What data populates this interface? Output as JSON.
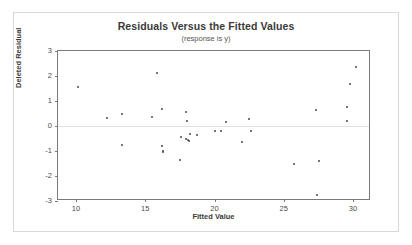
{
  "chart_data": {
    "type": "scatter",
    "title": "Residuals Versus the Fitted Values",
    "subtitle": "(response is y)",
    "xlabel": "Fitted Value",
    "ylabel": "Deleted Residual",
    "xlim": [
      8.7,
      31.3
    ],
    "ylim": [
      -3,
      3
    ],
    "xticks": [
      10,
      15,
      20,
      25,
      30
    ],
    "yticks": [
      3,
      2,
      1,
      0,
      -1,
      -2,
      -3
    ],
    "grid": false,
    "legend": null,
    "reference_line_y": 0,
    "marker_color": "#4a4a4a",
    "frame_color": "#7a7a7a",
    "points": [
      {
        "x": 10.15,
        "y": 1.55
      },
      {
        "x": 12.25,
        "y": 0.33
      },
      {
        "x": 13.35,
        "y": 0.5
      },
      {
        "x": 13.3,
        "y": -0.75
      },
      {
        "x": 15.5,
        "y": 0.35
      },
      {
        "x": 15.85,
        "y": 2.12
      },
      {
        "x": 16.2,
        "y": 0.7
      },
      {
        "x": 16.2,
        "y": -0.8
      },
      {
        "x": 16.25,
        "y": -1.0
      },
      {
        "x": 16.3,
        "y": -1.05
      },
      {
        "x": 17.5,
        "y": -1.37
      },
      {
        "x": 17.55,
        "y": -0.42
      },
      {
        "x": 17.95,
        "y": 0.58
      },
      {
        "x": 18.05,
        "y": 0.22
      },
      {
        "x": 17.95,
        "y": -0.5
      },
      {
        "x": 18.1,
        "y": -0.55
      },
      {
        "x": 18.15,
        "y": -0.58
      },
      {
        "x": 18.2,
        "y": -0.33
      },
      {
        "x": 18.75,
        "y": -0.35
      },
      {
        "x": 20.0,
        "y": -0.2
      },
      {
        "x": 20.45,
        "y": -0.21
      },
      {
        "x": 20.85,
        "y": 0.15
      },
      {
        "x": 22.0,
        "y": -0.65
      },
      {
        "x": 22.5,
        "y": 0.3
      },
      {
        "x": 22.6,
        "y": -0.18
      },
      {
        "x": 25.75,
        "y": -1.5
      },
      {
        "x": 27.35,
        "y": 0.65
      },
      {
        "x": 27.55,
        "y": -1.38
      },
      {
        "x": 27.4,
        "y": -2.75
      },
      {
        "x": 29.55,
        "y": 0.75
      },
      {
        "x": 29.6,
        "y": 0.2
      },
      {
        "x": 29.75,
        "y": 1.68
      },
      {
        "x": 30.2,
        "y": 2.35
      }
    ]
  }
}
